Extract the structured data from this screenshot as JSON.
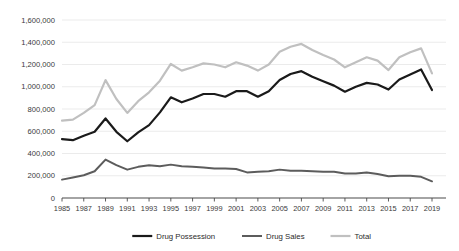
{
  "chart_data": {
    "type": "line",
    "title": "",
    "subtitle": "",
    "xlabel": "",
    "ylabel": "",
    "grid": true,
    "legend_position": "bottom",
    "ylim": [
      0,
      1600000
    ],
    "ytick_labels": [
      "0",
      "200,000",
      "400,000",
      "600,000",
      "800,000",
      "1,000,000",
      "1,200,000",
      "1,400,000",
      "1,600,000"
    ],
    "ytick_values": [
      0,
      200000,
      400000,
      600000,
      800000,
      1000000,
      1200000,
      1400000,
      1600000
    ],
    "xlim": [
      1985,
      2019
    ],
    "x": [
      1985,
      1986,
      1987,
      1988,
      1989,
      1990,
      1991,
      1992,
      1993,
      1994,
      1995,
      1996,
      1997,
      1998,
      1999,
      2000,
      2001,
      2002,
      2003,
      2004,
      2005,
      2006,
      2007,
      2008,
      2009,
      2010,
      2011,
      2012,
      2013,
      2014,
      2015,
      2016,
      2017,
      2018,
      2019
    ],
    "xtick_labels": [
      "1985",
      "1987",
      "1989",
      "1991",
      "1993",
      "1995",
      "1997",
      "1999",
      "2001",
      "2003",
      "2005",
      "2007",
      "2009",
      "2011",
      "2013",
      "2015",
      "2017",
      "2019"
    ],
    "xtick_values": [
      1985,
      1987,
      1989,
      1991,
      1993,
      1995,
      1997,
      1999,
      2001,
      2003,
      2005,
      2007,
      2009,
      2011,
      2013,
      2015,
      2017,
      2019
    ],
    "series": [
      {
        "name": "Drug Possession",
        "color": "#1a1a1a",
        "width": 2.2,
        "values": [
          530000,
          520000,
          560000,
          595000,
          715000,
          595000,
          510000,
          590000,
          655000,
          770000,
          905000,
          860000,
          895000,
          935000,
          935000,
          910000,
          960000,
          960000,
          910000,
          960000,
          1060000,
          1115000,
          1140000,
          1090000,
          1050000,
          1010000,
          955000,
          1000000,
          1035000,
          1020000,
          975000,
          1065000,
          1110000,
          1155000,
          970000
        ]
      },
      {
        "name": "Drug Sales",
        "color": "#5c5c5c",
        "width": 2.0,
        "values": [
          165000,
          185000,
          205000,
          240000,
          345000,
          295000,
          255000,
          280000,
          295000,
          285000,
          300000,
          285000,
          280000,
          275000,
          265000,
          265000,
          260000,
          230000,
          235000,
          240000,
          255000,
          245000,
          245000,
          240000,
          235000,
          235000,
          220000,
          220000,
          230000,
          215000,
          195000,
          200000,
          200000,
          190000,
          150000
        ]
      },
      {
        "name": "Total",
        "color": "#c0c0c0",
        "width": 2.2,
        "values": [
          695000,
          705000,
          765000,
          835000,
          1060000,
          890000,
          765000,
          870000,
          950000,
          1055000,
          1205000,
          1145000,
          1175000,
          1210000,
          1200000,
          1175000,
          1220000,
          1190000,
          1145000,
          1200000,
          1315000,
          1360000,
          1385000,
          1330000,
          1285000,
          1245000,
          1175000,
          1220000,
          1265000,
          1235000,
          1150000,
          1265000,
          1310000,
          1345000,
          1120000
        ]
      }
    ]
  },
  "legend": {
    "items": [
      {
        "label": "Drug Possession",
        "color": "#1a1a1a"
      },
      {
        "label": "Drug Sales",
        "color": "#5c5c5c"
      },
      {
        "label": "Total",
        "color": "#c0c0c0"
      }
    ]
  }
}
